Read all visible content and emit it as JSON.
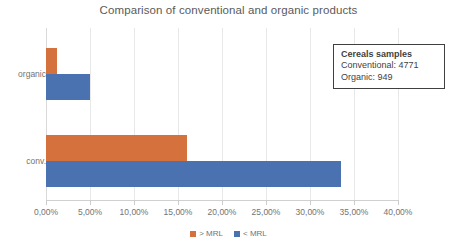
{
  "chart_data": {
    "type": "bar",
    "orientation": "horizontal",
    "title": "Comparison of conventional and organic products",
    "xlabel": "",
    "ylabel": "",
    "categories": [
      "conv.",
      "organic"
    ],
    "series": [
      {
        "name": "> MRL",
        "color": "#d4713c",
        "values": [
          16.0,
          1.3
        ]
      },
      {
        "name": "< MRL",
        "color": "#4a71b0",
        "values": [
          33.5,
          5.0
        ]
      }
    ],
    "xlim": [
      0,
      40
    ],
    "xticks": [
      0,
      5,
      10,
      15,
      20,
      25,
      30,
      35,
      40
    ],
    "xtick_labels": [
      "0,00%",
      "5,00%",
      "10,00%",
      "15,00%",
      "20,00%",
      "25,00%",
      "30,00%",
      "35,00%",
      "40,00%"
    ],
    "grid": true,
    "legend_position": "bottom",
    "annotation": {
      "title": "Cereals samples",
      "lines": [
        "Conventional: 4771",
        "Organic: 949"
      ]
    }
  },
  "legend": {
    "items": [
      {
        "label": "> MRL",
        "color": "#d4713c"
      },
      {
        "label": "< MRL",
        "color": "#4a71b0"
      }
    ]
  },
  "colors": {
    "above_mrl": "#d4713c",
    "below_mrl": "#4a71b0",
    "gridline": "#e8e8e8",
    "text": "#737373"
  }
}
